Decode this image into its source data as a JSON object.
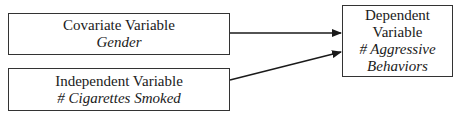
{
  "diagram": {
    "nodes": [
      {
        "id": "covariate",
        "role": "Covariate Variable",
        "variable": "Gender"
      },
      {
        "id": "independent",
        "role": "Independent Variable",
        "variable": "# Cigarettes Smoked"
      },
      {
        "id": "dependent",
        "role_line1": "Dependent",
        "role_line2": "Variable",
        "variable_line1": "# Aggressive",
        "variable_line2": "Behaviors"
      }
    ],
    "edges": [
      {
        "from": "covariate",
        "to": "dependent"
      },
      {
        "from": "independent",
        "to": "dependent"
      }
    ],
    "colors": {
      "stroke": "#333333",
      "background": "#ffffff",
      "text": "#1a1a1a"
    }
  }
}
